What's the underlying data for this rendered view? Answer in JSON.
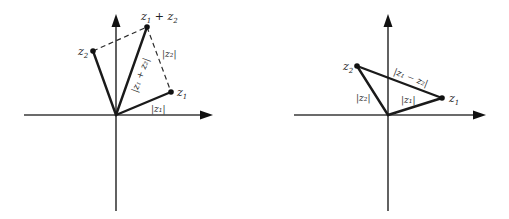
{
  "diagrams": {
    "left": {
      "title": "Triangle inequality: vector sum",
      "points": {
        "z1": {
          "label": "z",
          "sub": "1"
        },
        "z2": {
          "label": "z",
          "sub": "2"
        },
        "sum": {
          "label": "z",
          "sub1": "1",
          "op": " + ",
          "label2": "z",
          "sub2": "2"
        }
      },
      "segment_labels": {
        "mod_z1": "|z₁|",
        "mod_z2": "|z₂|",
        "mod_sum": "|z₁ + z₂|"
      }
    },
    "right": {
      "title": "Triangle inequality: vector difference",
      "points": {
        "z1": {
          "label": "z",
          "sub": "1"
        },
        "z2": {
          "label": "z",
          "sub": "2"
        }
      },
      "segment_labels": {
        "mod_z1": "|z₁|",
        "mod_z2": "|z₂|",
        "mod_diff": "|z₁ − z₂|"
      }
    }
  },
  "colors": {
    "line": "#1a1a1a",
    "axis": "#3a3a3a",
    "background": "#ffffff"
  }
}
